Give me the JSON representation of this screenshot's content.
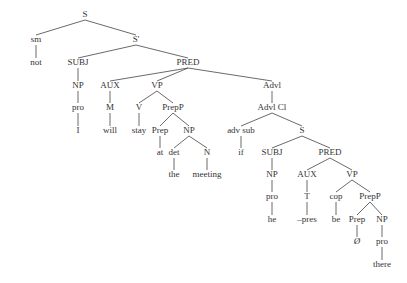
{
  "diagram": {
    "type": "syntax-tree",
    "nodes": [
      {
        "id": "S",
        "label": "S",
        "x": 85,
        "y": 17
      },
      {
        "id": "sm",
        "label": "sm",
        "x": 36,
        "y": 42
      },
      {
        "id": "not",
        "label": "not",
        "x": 36,
        "y": 65
      },
      {
        "id": "S1",
        "label": "S'",
        "x": 136,
        "y": 42
      },
      {
        "id": "SUBJ1",
        "label": "SUBJ",
        "x": 78,
        "y": 65
      },
      {
        "id": "NP1",
        "label": "NP",
        "x": 78,
        "y": 88
      },
      {
        "id": "pro1",
        "label": "pro",
        "x": 78,
        "y": 110
      },
      {
        "id": "I",
        "label": "I",
        "x": 78,
        "y": 133
      },
      {
        "id": "PRED1",
        "label": "PRED",
        "x": 188,
        "y": 65
      },
      {
        "id": "AUX1",
        "label": "AUX",
        "x": 110,
        "y": 88
      },
      {
        "id": "M",
        "label": "M",
        "x": 110,
        "y": 110
      },
      {
        "id": "will",
        "label": "will",
        "x": 110,
        "y": 133
      },
      {
        "id": "VP1",
        "label": "VP",
        "x": 157,
        "y": 88
      },
      {
        "id": "V",
        "label": "V",
        "x": 139,
        "y": 110
      },
      {
        "id": "stay",
        "label": "stay",
        "x": 139,
        "y": 133
      },
      {
        "id": "PrepP1",
        "label": "PrepP",
        "x": 173,
        "y": 110
      },
      {
        "id": "Prep1",
        "label": "Prep",
        "x": 160,
        "y": 133
      },
      {
        "id": "at",
        "label": "at",
        "x": 160,
        "y": 155
      },
      {
        "id": "NP2",
        "label": "NP",
        "x": 189,
        "y": 133
      },
      {
        "id": "det",
        "label": "det",
        "x": 174,
        "y": 155
      },
      {
        "id": "the",
        "label": "the",
        "x": 174,
        "y": 177
      },
      {
        "id": "N",
        "label": "N",
        "x": 207,
        "y": 155
      },
      {
        "id": "meeting",
        "label": "meeting",
        "x": 207,
        "y": 177
      },
      {
        "id": "Advl",
        "label": "Advl",
        "x": 272,
        "y": 88
      },
      {
        "id": "AdvlCl",
        "label": "Advl Cl",
        "x": 272,
        "y": 110
      },
      {
        "id": "advsub",
        "label": "adv sub",
        "x": 241,
        "y": 133
      },
      {
        "id": "if",
        "label": "if",
        "x": 241,
        "y": 155
      },
      {
        "id": "S2",
        "label": "S",
        "x": 302,
        "y": 133
      },
      {
        "id": "SUBJ2",
        "label": "SUBJ",
        "x": 272,
        "y": 155
      },
      {
        "id": "NP3",
        "label": "NP",
        "x": 272,
        "y": 177
      },
      {
        "id": "pro2",
        "label": "pro",
        "x": 272,
        "y": 199
      },
      {
        "id": "he",
        "label": "he",
        "x": 272,
        "y": 222
      },
      {
        "id": "PRED2",
        "label": "PRED",
        "x": 330,
        "y": 155
      },
      {
        "id": "AUX2",
        "label": "AUX",
        "x": 307,
        "y": 177
      },
      {
        "id": "T",
        "label": "T",
        "x": 307,
        "y": 199
      },
      {
        "id": "pres",
        "label": "–pres",
        "x": 307,
        "y": 222
      },
      {
        "id": "VP2",
        "label": "VP",
        "x": 352,
        "y": 177
      },
      {
        "id": "cop",
        "label": "cop",
        "x": 336,
        "y": 199
      },
      {
        "id": "be",
        "label": "be",
        "x": 336,
        "y": 222
      },
      {
        "id": "PrepP2",
        "label": "PrepP",
        "x": 370,
        "y": 199
      },
      {
        "id": "Prep2",
        "label": "Prep",
        "x": 357,
        "y": 222
      },
      {
        "id": "null",
        "label": "Ø",
        "x": 357,
        "y": 244
      },
      {
        "id": "NP4",
        "label": "NP",
        "x": 382,
        "y": 222
      },
      {
        "id": "pro3",
        "label": "pro",
        "x": 382,
        "y": 244
      },
      {
        "id": "there",
        "label": "there",
        "x": 382,
        "y": 267
      }
    ]
  }
}
